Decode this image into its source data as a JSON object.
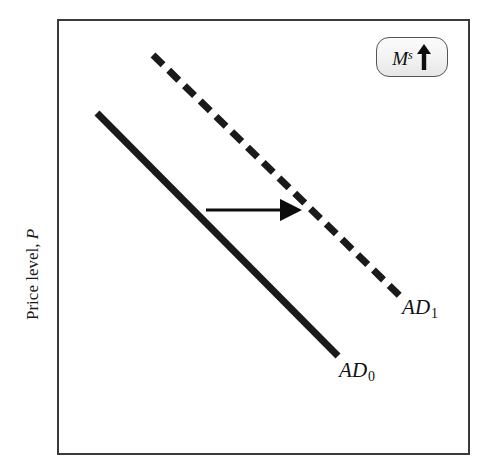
{
  "figure": {
    "type": "economics-ad-shift-diagram",
    "background_color": "#ffffff",
    "frame_color": "#3a3a3a"
  },
  "axes": {
    "y_label_prefix": "Price level, ",
    "y_label_variable": "P"
  },
  "badge": {
    "name": "money-supply-increase",
    "variable": "M",
    "superscript": "s",
    "arrow_direction": "up",
    "arrow_icon": "up-arrow-icon",
    "fill_color": "#f2f2f2",
    "border_color": "#555555"
  },
  "curves": [
    {
      "id": "AD0",
      "label_text": "AD",
      "label_subscript": "0",
      "style": "solid",
      "color": "#1a1a1a",
      "stroke_width": 7,
      "x1": 97,
      "y1": 113,
      "x2": 338,
      "y2": 356
    },
    {
      "id": "AD1",
      "label_text": "AD",
      "label_subscript": "1",
      "style": "dashed",
      "color": "#1a1a1a",
      "stroke_width": 7,
      "dash_length": 14,
      "dash_gap": 8,
      "x1": 153,
      "y1": 55,
      "x2": 400,
      "y2": 296
    }
  ],
  "annotations": [
    {
      "id": "shift-arrow",
      "name": "rightward-shift-arrow",
      "direction": "right",
      "color": "#0d0d0d",
      "x1": 206,
      "y1": 210,
      "x2": 297,
      "y2": 210
    }
  ],
  "chart_data": {
    "type": "line",
    "title": "",
    "xlabel": "",
    "ylabel": "Price level, P",
    "grid": false,
    "legend": "inline-curve-labels",
    "annotations": [
      "Ms up",
      "rightward shift arrow"
    ],
    "series": [
      {
        "name": "AD0",
        "style": "solid",
        "points": [
          [
            97,
            113
          ],
          [
            338,
            356
          ]
        ]
      },
      {
        "name": "AD1",
        "style": "dashed",
        "points": [
          [
            153,
            55
          ],
          [
            400,
            296
          ]
        ]
      }
    ]
  }
}
